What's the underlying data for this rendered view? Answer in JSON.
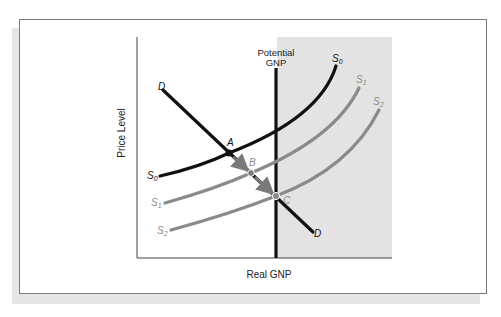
{
  "diagram": {
    "axes": {
      "xlabel": "Real GNP",
      "ylabel": "Price Level"
    },
    "potential_line_label_1": "Potential",
    "potential_line_label_2": "GNP",
    "curves": {
      "demand": {
        "label_start": "D",
        "label_end": "D",
        "color": "#111111"
      },
      "s0": {
        "label_left": "S",
        "label_left_sub": "0",
        "label_right": "S",
        "label_right_sub": "0",
        "color": "#111111"
      },
      "s1": {
        "label_left": "S",
        "label_left_sub": "1",
        "label_right": "S",
        "label_right_sub": "1",
        "color": "#8a8a8a"
      },
      "s2": {
        "label_left": "S",
        "label_left_sub": "2",
        "label_right": "S",
        "label_right_sub": "2",
        "color": "#8a8a8a"
      }
    },
    "points": [
      {
        "label": "A",
        "color": "#111111"
      },
      {
        "label": "B",
        "color": "#8a8a8a"
      },
      {
        "label": "C",
        "color": "#8a8a8a"
      }
    ],
    "shaded_region_color": "#e3e3e3"
  }
}
